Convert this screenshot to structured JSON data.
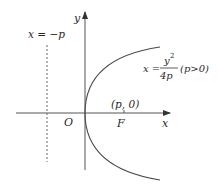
{
  "diagram": {
    "type": "parabola",
    "equation": {
      "lhs": "x =",
      "numerator": "y",
      "exponent": "2",
      "denominator": "4p",
      "condition": "(p>0)"
    },
    "axes": {
      "x_label": "x",
      "y_label": "y",
      "origin_label": "O"
    },
    "directrix": {
      "label": "x = −p"
    },
    "focus": {
      "label": "F",
      "coord_label": "(p, 0)"
    },
    "colors": {
      "stroke": "#4a4a4a",
      "text": "#2a2a2a",
      "background": "#ffffff"
    }
  }
}
